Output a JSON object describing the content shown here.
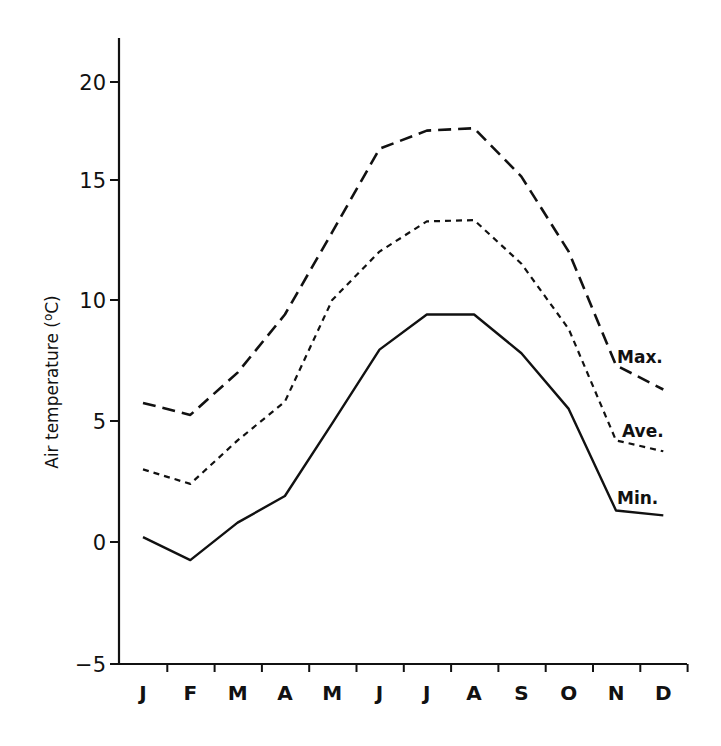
{
  "chart_data": {
    "type": "line",
    "title": "",
    "xlabel": "",
    "ylabel": "Air temperature (oC)",
    "ylabel_parts": {
      "main": "Air temperature (",
      "sup": "o",
      "unit": "C)"
    },
    "categories": [
      "J",
      "F",
      "M",
      "A",
      "M",
      "J",
      "J",
      "A",
      "S",
      "O",
      "N",
      "D"
    ],
    "yticks": [
      20,
      15,
      10,
      5,
      0,
      -5
    ],
    "ytick_labels": [
      "20",
      "15",
      "10",
      "5",
      "0",
      "−5"
    ],
    "ylim": [
      -5,
      21
    ],
    "grid": false,
    "legend": "inline labels at right end of each series",
    "series": [
      {
        "name": "Max.",
        "style": "long-dash",
        "values": [
          5.75,
          5.25,
          7.0,
          9.4,
          12.8,
          16.25,
          17.0,
          17.1,
          15.1,
          12.0,
          7.3,
          6.3
        ]
      },
      {
        "name": "Ave.",
        "style": "short-dash",
        "values": [
          3.0,
          2.4,
          4.2,
          5.8,
          10.0,
          12.0,
          13.25,
          13.3,
          11.5,
          8.8,
          4.2,
          3.75
        ]
      },
      {
        "name": "Min.",
        "style": "solid",
        "values": [
          0.2,
          -0.75,
          0.8,
          1.9,
          4.9,
          7.95,
          9.4,
          9.4,
          7.8,
          5.5,
          1.3,
          1.1
        ]
      }
    ]
  }
}
